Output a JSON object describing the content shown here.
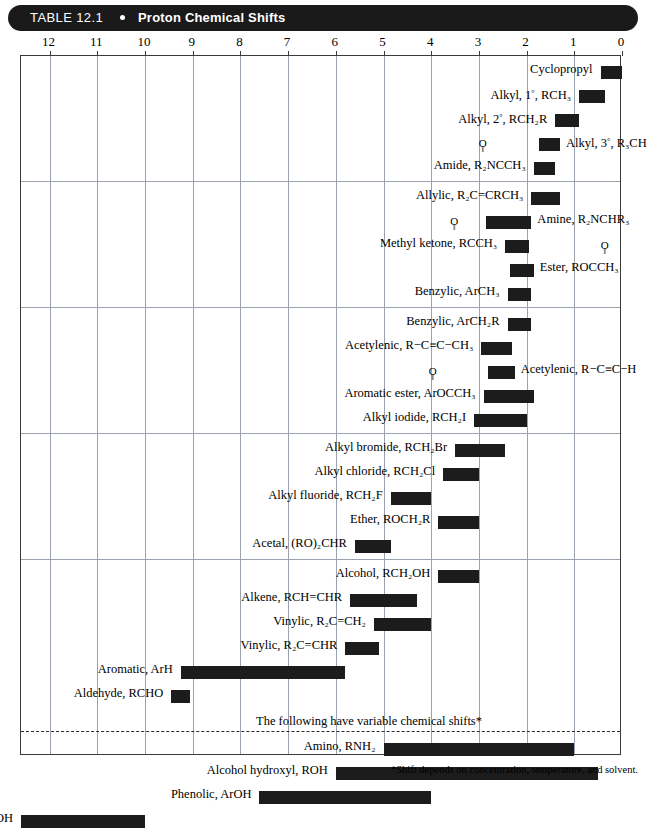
{
  "header": {
    "table_number": "TABLE 12.1",
    "bullet": "•",
    "title": "Proton Chemical Shifts"
  },
  "axis": {
    "ticks": [
      12,
      11,
      10,
      9,
      8,
      7,
      6,
      5,
      4,
      3,
      2,
      1,
      0
    ],
    "min": 0,
    "max": 12.6,
    "direction": "reversed"
  },
  "variable_note": "The following have variable chemical shifts*",
  "footnote": "*Shift depends on concentration, temperature, and solvent.",
  "chart_data": {
    "type": "bar",
    "orientation": "horizontal-range",
    "title": "Proton Chemical Shifts",
    "xlabel": "Chemical shift (δ, ppm)",
    "ylabel": "",
    "xlim": [
      12.6,
      0
    ],
    "grid": true,
    "bar_color": "#1c1c1c",
    "groups": [
      {
        "rows": [
          {
            "label": "Cyclopropyl",
            "formula": "",
            "start": 0.0,
            "end": 0.45,
            "label_side": "left"
          },
          {
            "label": "Alkyl, 1°, RCH₃",
            "formula": "",
            "start": 0.35,
            "end": 0.9,
            "label_side": "left"
          },
          {
            "label": "Alkyl, 2°, RCH₂R",
            "formula": "",
            "start": 0.9,
            "end": 1.4,
            "label_side": "left"
          },
          {
            "label": "Alkyl, 3°, R₃CH",
            "formula": "",
            "start": 1.3,
            "end": 1.75,
            "label_side": "right"
          },
          {
            "label": "Amide, R₂NCCH₃",
            "formula": "carbonyl",
            "start": 1.4,
            "end": 1.85,
            "label_side": "left"
          }
        ]
      },
      {
        "rows": [
          {
            "label": "Allylic, R₂C=CRCH₃",
            "formula": "",
            "start": 1.3,
            "end": 1.9,
            "label_side": "left"
          },
          {
            "label": "Amine, R₂NCHR₃",
            "formula": "",
            "start": 1.9,
            "end": 2.85,
            "label_side": "right"
          },
          {
            "label": "Methyl ketone, RCCH₃",
            "formula": "carbonyl",
            "start": 1.95,
            "end": 2.45,
            "label_side": "left"
          },
          {
            "label": "Ester, ROCCH₃",
            "formula": "carbonyl",
            "start": 1.85,
            "end": 2.35,
            "label_side": "right"
          },
          {
            "label": "Benzylic, ArCH₃",
            "formula": "",
            "start": 1.9,
            "end": 2.4,
            "label_side": "left"
          }
        ]
      },
      {
        "rows": [
          {
            "label": "Benzylic, ArCH₂R",
            "formula": "",
            "start": 1.9,
            "end": 2.4,
            "label_side": "left"
          },
          {
            "label": "Acetylenic, R−C≡C−CH₃",
            "formula": "",
            "start": 2.3,
            "end": 2.95,
            "label_side": "left"
          },
          {
            "label": "Acetylenic, R−C≡C−H",
            "formula": "",
            "start": 2.25,
            "end": 2.8,
            "label_side": "right"
          },
          {
            "label": "Aromatic ester, ArOCCH₃",
            "formula": "carbonyl",
            "start": 1.85,
            "end": 2.9,
            "label_side": "left"
          },
          {
            "label": "Alkyl iodide, RCH₂I",
            "formula": "",
            "start": 2.0,
            "end": 3.1,
            "label_side": "left"
          }
        ]
      },
      {
        "rows": [
          {
            "label": "Alkyl bromide, RCH₂Br",
            "formula": "",
            "start": 2.45,
            "end": 3.5,
            "label_side": "left"
          },
          {
            "label": "Alkyl chloride, RCH₂Cl",
            "formula": "",
            "start": 3.0,
            "end": 3.75,
            "label_side": "left"
          },
          {
            "label": "Alkyl fluoride, RCH₂F",
            "formula": "",
            "start": 4.0,
            "end": 4.85,
            "label_side": "left"
          },
          {
            "label": "Ether, ROCH₂R",
            "formula": "",
            "start": 3.0,
            "end": 3.85,
            "label_side": "left"
          },
          {
            "label": "Acetal, (RO)₂CHR",
            "formula": "",
            "start": 4.85,
            "end": 5.6,
            "label_side": "left"
          }
        ]
      },
      {
        "rows": [
          {
            "label": "Alcohol, RCH₂OH",
            "formula": "",
            "start": 3.0,
            "end": 3.85,
            "label_side": "left"
          },
          {
            "label": "Alkene, RCH=CHR",
            "formula": "",
            "start": 4.3,
            "end": 5.7,
            "label_side": "left"
          },
          {
            "label": "Vinylic, R₂C=CH₂",
            "formula": "",
            "start": 4.0,
            "end": 5.2,
            "label_side": "left"
          },
          {
            "label": "Vinylic, R₂C=CHR",
            "formula": "",
            "start": 5.1,
            "end": 5.8,
            "label_side": "left"
          },
          {
            "label": "Aromatic, ArH",
            "formula": "",
            "start": 5.8,
            "end": 9.25,
            "label_side": "left"
          },
          {
            "label": "Aldehyde, RCHO",
            "formula": "",
            "start": 9.05,
            "end": 9.45,
            "label_side": "left"
          }
        ]
      },
      {
        "variable": true,
        "rows": [
          {
            "label": "Amino, RNH₂",
            "formula": "",
            "start": 1.0,
            "end": 5.0,
            "label_side": "left"
          },
          {
            "label": "Alcohol hydroxyl, ROH",
            "formula": "",
            "start": 0.5,
            "end": 6.0,
            "label_side": "left"
          },
          {
            "label": "Phenolic, ArOH",
            "formula": "",
            "start": 4.0,
            "end": 7.6,
            "label_side": "left"
          },
          {
            "label": "Carboxylic, RCOOH",
            "formula": "",
            "start": 10.0,
            "end": 12.6,
            "label_side": "left"
          }
        ]
      }
    ]
  }
}
